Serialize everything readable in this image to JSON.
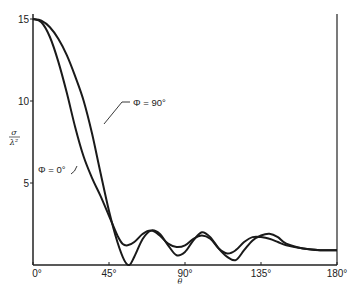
{
  "chart_data": {
    "type": "line",
    "title": "",
    "xlabel": "θ",
    "ylabel": "σ/λ²",
    "xlim": [
      0,
      180
    ],
    "ylim": [
      0,
      15
    ],
    "grid": false,
    "legend": "inline annotations",
    "x_ticks": [
      "0°",
      "45°",
      "90°",
      "135°",
      "180°"
    ],
    "x_tick_values": [
      0,
      45,
      90,
      135,
      180
    ],
    "y_ticks": [
      "5",
      "10",
      "15"
    ],
    "y_tick_values": [
      5,
      10,
      15
    ],
    "annotations": [
      {
        "text": "Φ = 90°",
        "target_series": "Φ = 90°"
      },
      {
        "text": "Φ = 0°",
        "target_series": "Φ = 0°"
      }
    ],
    "series": [
      {
        "name": "Φ = 0°",
        "x": [
          0,
          5,
          10,
          15,
          20,
          25,
          30,
          35,
          40,
          45,
          50,
          53,
          56,
          60,
          65,
          70,
          75,
          80,
          85,
          90,
          95,
          100,
          105,
          110,
          115,
          120,
          125,
          130,
          135,
          140,
          145,
          150,
          160,
          170,
          180
        ],
        "values": [
          15.0,
          14.8,
          13.9,
          12.4,
          10.5,
          8.4,
          6.6,
          5.3,
          4.2,
          3.0,
          1.8,
          1.3,
          1.2,
          1.4,
          1.9,
          2.1,
          1.8,
          1.3,
          1.1,
          1.2,
          1.6,
          1.8,
          1.6,
          1.0,
          0.7,
          0.9,
          1.4,
          1.7,
          1.7,
          1.6,
          1.4,
          1.2,
          1.0,
          0.9,
          0.9
        ]
      },
      {
        "name": "Φ = 90°",
        "x": [
          0,
          5,
          10,
          15,
          20,
          25,
          30,
          35,
          40,
          45,
          50,
          54,
          57,
          60,
          65,
          70,
          75,
          80,
          85,
          90,
          95,
          100,
          105,
          110,
          115,
          120,
          125,
          130,
          135,
          140,
          145,
          150,
          160,
          170,
          180
        ],
        "values": [
          15.0,
          14.9,
          14.5,
          13.8,
          12.8,
          11.5,
          10.0,
          8.0,
          5.6,
          3.3,
          1.4,
          0.3,
          0.0,
          0.5,
          1.6,
          2.1,
          1.9,
          1.2,
          0.6,
          0.8,
          1.5,
          2.0,
          1.7,
          1.0,
          0.5,
          0.3,
          0.9,
          1.5,
          1.8,
          1.9,
          1.7,
          1.3,
          1.0,
          0.9,
          0.9
        ]
      }
    ]
  }
}
